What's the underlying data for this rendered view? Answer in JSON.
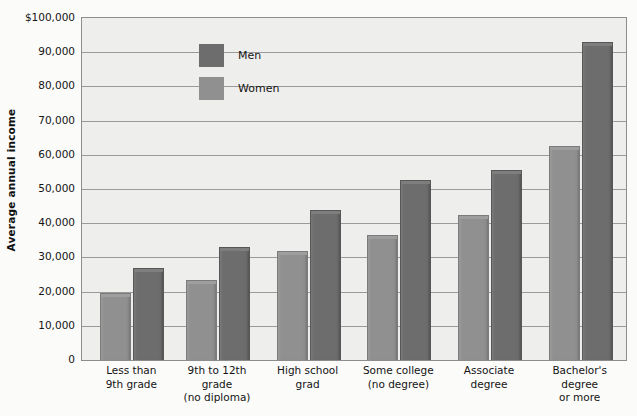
{
  "chart_data": {
    "type": "bar",
    "title": "",
    "xlabel": "",
    "ylabel": "Average annual income",
    "ylim": [
      0,
      100000
    ],
    "grid": true,
    "legend_position": "top-left",
    "categories": [
      "Less than\n9th grade",
      "9th to 12th\ngrade\n(no diploma)",
      "High school\ngrad",
      "Some college\n(no degree)",
      "Associate\ndegree",
      "Bachelor's\ndegree\nor more"
    ],
    "category_lines": [
      [
        "Less than",
        "9th grade"
      ],
      [
        "9th to 12th",
        "grade",
        "(no diploma)"
      ],
      [
        "High school",
        "grad"
      ],
      [
        "Some college",
        "(no degree)"
      ],
      [
        "Associate",
        "degree"
      ],
      [
        "Bachelor's",
        "degree",
        "or more"
      ]
    ],
    "series": [
      {
        "name": "Women",
        "color": "#909090",
        "values": [
          19500,
          23500,
          32000,
          36500,
          42500,
          62500
        ]
      },
      {
        "name": "Men",
        "color": "#6d6d6d",
        "values": [
          27000,
          33000,
          44000,
          52500,
          55500,
          93000
        ]
      }
    ],
    "y_ticks": [
      {
        "value": 100000,
        "label": "$100,000"
      },
      {
        "value": 90000,
        "label": "90,000"
      },
      {
        "value": 80000,
        "label": "80,000"
      },
      {
        "value": 70000,
        "label": "70,000"
      },
      {
        "value": 60000,
        "label": "60,000"
      },
      {
        "value": 50000,
        "label": "50,000"
      },
      {
        "value": 40000,
        "label": "40,000"
      },
      {
        "value": 30000,
        "label": "30,000"
      },
      {
        "value": 20000,
        "label": "20,000"
      },
      {
        "value": 10000,
        "label": "10,000"
      },
      {
        "value": 0,
        "label": "0"
      }
    ]
  },
  "legend": {
    "items": [
      {
        "label": "Men",
        "key": "men"
      },
      {
        "label": "Women",
        "key": "women"
      }
    ]
  },
  "axis": {
    "y_title": "Average annual income"
  },
  "colors": {
    "men": "#6d6d6d",
    "women": "#909090",
    "plot_background": "#eeeeec",
    "page_background": "#fbfbfa",
    "gridline": "#9a9a9a",
    "axis": "#8d8d8d"
  }
}
